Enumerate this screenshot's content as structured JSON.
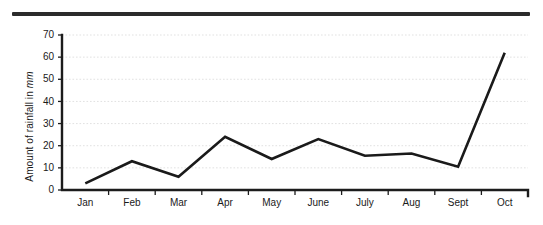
{
  "figure": {
    "top_rule_name": "horizontal-rule",
    "background_color": "#ffffff",
    "line_color": "#1a1a1a",
    "grid_color": "#dedede"
  },
  "axis_title": {
    "prefix": "Amount of rainfall in ",
    "unit": "mm"
  },
  "chart_data": {
    "type": "line",
    "title": "",
    "xlabel": "",
    "ylabel": "Amount of rainfall in mm",
    "categories": [
      "Jan",
      "Feb",
      "Mar",
      "Apr",
      "May",
      "June",
      "July",
      "Aug",
      "Sept",
      "Oct"
    ],
    "values": [
      3,
      13,
      6,
      24,
      14,
      23,
      15.5,
      16.5,
      10.5,
      62
    ],
    "series": [
      {
        "name": "Amount of rainfall",
        "values": [
          3,
          13,
          6,
          24,
          14,
          23,
          15.5,
          16.5,
          10.5,
          62
        ]
      }
    ],
    "ylim": [
      0,
      70
    ],
    "ytick_labels": [
      "0",
      "10",
      "20",
      "30",
      "40",
      "50",
      "60",
      "70"
    ],
    "ytick_values": [
      0,
      10,
      20,
      30,
      40,
      50,
      60,
      70
    ],
    "grid": true,
    "grid_axis": "y",
    "legend": false,
    "legend_position": "none",
    "markers": false
  }
}
